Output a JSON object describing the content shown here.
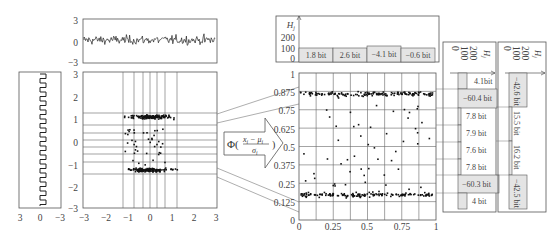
{
  "figure": {
    "type": "diagram"
  },
  "left_panel": {
    "name": "rotated-square-wave",
    "x_ticks": [
      "3",
      "0",
      "−3"
    ]
  },
  "top_panel": {
    "name": "noise-time-series",
    "y_ticks": [
      "3",
      "0",
      "−3"
    ]
  },
  "scatter_left": {
    "x_ticks": [
      "−3",
      "−2",
      "−1",
      "0",
      "1",
      "2",
      "3"
    ],
    "y_ticks": [
      "3",
      "2",
      "1",
      "0",
      "−1",
      "−2",
      "−3"
    ]
  },
  "transform": {
    "label_phi": "Φ(",
    "numerator": "x",
    "numerator_sub": "i",
    "minus": " − μ",
    "minus_sub": "i",
    "close": ")",
    "denominator": "σ",
    "denominator_sub": "i"
  },
  "scatter_right": {
    "x_ticks": [
      "0",
      "0.25",
      "0.5",
      "0.75",
      "1"
    ],
    "y_ticks": [
      "0",
      "0.125",
      "0.25",
      "0.375",
      "0.5",
      "0.625",
      "0.75",
      "0.875",
      "1"
    ]
  },
  "top_histogram": {
    "axis_label": "H",
    "axis_sub": "j",
    "ticks": [
      "200",
      "100",
      "0"
    ],
    "bins": [
      "1.8 bit",
      "2.6 bit",
      "−4.1 bit",
      "−0.6 bit"
    ]
  },
  "right_histogram_1": {
    "axis_label": "H",
    "axis_sub": "j",
    "ticks": [
      "200",
      "100",
      "0"
    ],
    "bins": [
      "4.1bit",
      "−60.4 bit",
      "7.8 bit",
      "7.9 bit",
      "7.6 bit",
      "7.8 bit",
      "−60.3 bit",
      "4 bit"
    ]
  },
  "right_histogram_2": {
    "axis_label": "H",
    "axis_sub": "j",
    "ticks": [
      "200",
      "100",
      "0"
    ],
    "bins": [
      "−42.6 bit",
      "15.5 bit",
      "16.2 bit",
      "−42.5 bit"
    ]
  },
  "colors": {
    "line": "#555555",
    "dot": "#111111",
    "bar_fill": "#e4e4e4",
    "grid": "#777777"
  },
  "chart_data": [
    {
      "type": "line",
      "title": "noise signal",
      "ylim": [
        -3,
        3
      ],
      "y_ticks": [
        3,
        0,
        -3
      ]
    },
    {
      "type": "scatter",
      "title": "raw samples",
      "xlim": [
        -3,
        3
      ],
      "ylim": [
        -3,
        3
      ],
      "note": "two clusters near y=1 and y=-1"
    },
    {
      "type": "scatter",
      "title": "CDF transformed samples",
      "xlim": [
        0,
        1
      ],
      "ylim": [
        0,
        1
      ],
      "y_ticks": [
        0,
        0.125,
        0.25,
        0.375,
        0.5,
        0.625,
        0.75,
        0.875,
        1
      ],
      "x_ticks": [
        0,
        0.25,
        0.5,
        0.75,
        1
      ],
      "note": "two clusters near y=0.85 and y=0.15"
    },
    {
      "type": "bar",
      "title": "horizontal bin entropy",
      "categories": [
        "bin1",
        "bin2",
        "bin3",
        "bin4"
      ],
      "labels": [
        "1.8 bit",
        "2.6 bit",
        "−4.1 bit",
        "−0.6 bit"
      ],
      "values": [
        1.8,
        2.6,
        -4.1,
        -0.6
      ]
    },
    {
      "type": "bar",
      "title": "vertical bin entropy (8 bins)",
      "labels": [
        "4.1bit",
        "−60.4 bit",
        "7.8 bit",
        "7.9 bit",
        "7.6 bit",
        "7.8 bit",
        "−60.3 bit",
        "4 bit"
      ],
      "values": [
        4.1,
        -60.4,
        7.8,
        7.9,
        7.6,
        7.8,
        -60.3,
        4.0
      ]
    },
    {
      "type": "bar",
      "title": "vertical bin entropy (4 bins)",
      "labels": [
        "−42.6 bit",
        "15.5 bit",
        "16.2 bit",
        "−42.5 bit"
      ],
      "values": [
        -42.6,
        15.5,
        16.2,
        -42.5
      ]
    }
  ]
}
